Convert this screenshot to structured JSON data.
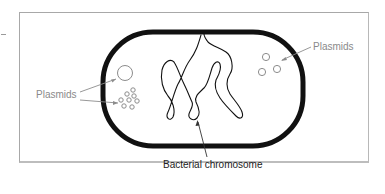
{
  "figure": {
    "labels": {
      "plasmids_left": "Plasmids",
      "plasmids_right": "Plasmids",
      "chromosome": "Bacterial chromosome"
    },
    "colors": {
      "cell_wall": "#111111",
      "chromosome": "#111111",
      "plasmid": "#8c8c8c",
      "leader_line_gray": "#8c8c8c",
      "leader_line_dark": "#333333",
      "frame": "#a8a8a8",
      "background": "#ffffff"
    },
    "components": [
      {
        "name": "cell_wall",
        "shape": "rounded capsule"
      },
      {
        "name": "bacterial_chromosome",
        "shape": "tangled loop"
      },
      {
        "name": "plasmid_large",
        "count": 1
      },
      {
        "name": "plasmid_cluster_left",
        "count": 8
      },
      {
        "name": "plasmid_cluster_right",
        "count": 3
      }
    ]
  }
}
